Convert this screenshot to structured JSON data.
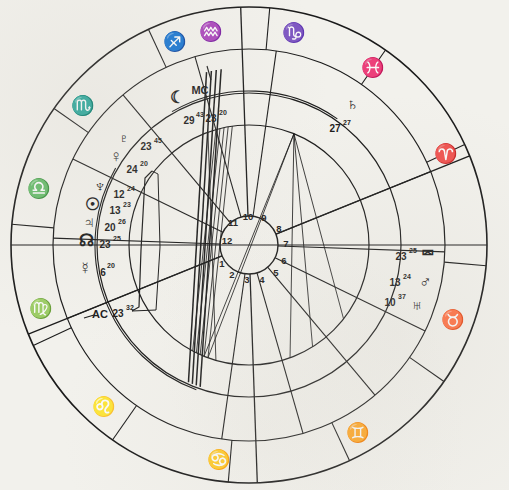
{
  "chart": {
    "background_color": "#f2f1ec",
    "ink_color": "#1a1a1a",
    "center": {
      "x": 249,
      "y": 245
    },
    "radii": {
      "outer_rim": 238,
      "sign_band_inner": 196,
      "house_band_inner": 152,
      "planet_ring": 120,
      "hub": 29
    }
  },
  "zodiac_signs": [
    {
      "name": "aries",
      "glyph": "♈",
      "angle_deg": 65,
      "label": "Aries"
    },
    {
      "name": "taurus",
      "glyph": "♉",
      "angle_deg": 110,
      "label": "Taurus"
    },
    {
      "name": "gemini",
      "glyph": "♊",
      "angle_deg": 150,
      "label": "Gemini"
    },
    {
      "name": "cancer",
      "glyph": "♋",
      "angle_deg": 188,
      "label": "Cancer"
    },
    {
      "name": "leo",
      "glyph": "♌",
      "angle_deg": 222,
      "label": "Leo"
    },
    {
      "name": "virgo",
      "glyph": "♍",
      "angle_deg": 253,
      "label": "Virgo"
    },
    {
      "name": "libra",
      "glyph": "♎",
      "angle_deg": 285,
      "label": "Libra"
    },
    {
      "name": "scorpio",
      "glyph": "♏",
      "angle_deg": 310,
      "label": "Scorpio"
    },
    {
      "name": "sagittarius",
      "glyph": "♐",
      "angle_deg": 340,
      "label": "Sagittarius"
    },
    {
      "name": "capricorn",
      "glyph": "♑",
      "angle_deg": 12,
      "label": "Capricorn"
    },
    {
      "name": "aquarius",
      "glyph": "♒",
      "angle_deg": 350,
      "label": "Aquarius"
    },
    {
      "name": "pisces",
      "glyph": "♓",
      "angle_deg": 35,
      "label": "Pisces"
    }
  ],
  "house_numbers": [
    {
      "label": "1",
      "x": 222,
      "y": 263
    },
    {
      "label": "2",
      "x": 232,
      "y": 274
    },
    {
      "label": "3",
      "x": 247,
      "y": 279
    },
    {
      "label": "4",
      "x": 262,
      "y": 279
    },
    {
      "label": "5",
      "x": 276,
      "y": 272
    },
    {
      "label": "6",
      "x": 284,
      "y": 260
    },
    {
      "label": "7",
      "x": 286,
      "y": 243
    },
    {
      "label": "8",
      "x": 279,
      "y": 228
    },
    {
      "label": "9",
      "x": 264,
      "y": 217
    },
    {
      "label": "10",
      "x": 248,
      "y": 216
    },
    {
      "label": "11",
      "x": 233,
      "y": 222
    },
    {
      "label": "12",
      "x": 227,
      "y": 240
    }
  ],
  "planets": [
    {
      "name": "pluto",
      "glyph": "♇",
      "label": "Pluto",
      "degree": "23",
      "minute": "45",
      "glyph_x": 124,
      "glyph_y": 138,
      "deg_x": 146,
      "deg_y": 146,
      "min_x": 158,
      "min_y": 140
    },
    {
      "name": "venus",
      "glyph": "♀",
      "label": "Venus",
      "degree": "24",
      "minute": "20",
      "glyph_x": 116,
      "glyph_y": 156,
      "deg_x": 132,
      "deg_y": 169,
      "min_x": 144,
      "min_y": 163
    },
    {
      "name": "neptune",
      "glyph": "♆",
      "label": "Neptune",
      "degree": "12",
      "minute": "24",
      "glyph_x": 100,
      "glyph_y": 186,
      "deg_x": 119,
      "deg_y": 194,
      "min_x": 131,
      "min_y": 188
    },
    {
      "name": "sun",
      "glyph": "☉",
      "label": "Sun",
      "degree": "13",
      "minute": "23",
      "glyph_x": 92,
      "glyph_y": 204,
      "deg_x": 115,
      "deg_y": 210,
      "min_x": 127,
      "min_y": 204
    },
    {
      "name": "jupiter",
      "glyph": "♃",
      "label": "Jupiter",
      "degree": "20",
      "minute": "26",
      "glyph_x": 89,
      "glyph_y": 222,
      "deg_x": 110,
      "deg_y": 227,
      "min_x": 122,
      "min_y": 221
    },
    {
      "name": "north-node",
      "glyph": "☊",
      "label": "North Node",
      "degree": "23",
      "minute": "25",
      "glyph_x": 86,
      "glyph_y": 240,
      "deg_x": 105,
      "deg_y": 244,
      "min_x": 117,
      "min_y": 238
    },
    {
      "name": "mercury",
      "glyph": "☿",
      "label": "Mercury",
      "degree": "6",
      "minute": "20",
      "glyph_x": 85,
      "glyph_y": 268,
      "deg_x": 103,
      "deg_y": 272,
      "min_x": 111,
      "min_y": 265
    },
    {
      "name": "ascendant",
      "glyph": "AC",
      "label": "Ascendant",
      "degree": "23",
      "minute": "32",
      "glyph_x": 100,
      "glyph_y": 314,
      "deg_x": 118,
      "deg_y": 313,
      "min_x": 130,
      "min_y": 307
    },
    {
      "name": "moon",
      "glyph": "☾",
      "label": "Moon",
      "degree": "29",
      "minute": "43",
      "glyph_x": 177,
      "glyph_y": 97,
      "deg_x": 189,
      "deg_y": 120,
      "min_x": 200,
      "min_y": 114
    },
    {
      "name": "midheaven",
      "glyph": "MC",
      "label": "Midheaven",
      "degree": "23",
      "minute": "20",
      "glyph_x": 200,
      "glyph_y": 90,
      "deg_x": 211,
      "deg_y": 118,
      "min_x": 223,
      "min_y": 112
    },
    {
      "name": "saturn",
      "glyph": "♄",
      "label": "Saturn",
      "degree": "27",
      "minute": "27",
      "glyph_x": 352,
      "glyph_y": 104,
      "deg_x": 335,
      "deg_y": 128,
      "min_x": 347,
      "min_y": 122
    },
    {
      "name": "south-node",
      "glyph": "⮹",
      "label": "South Node",
      "degree": "23",
      "minute": "25",
      "glyph_x": 428,
      "glyph_y": 253,
      "deg_x": 401,
      "deg_y": 256,
      "min_x": 413,
      "min_y": 250
    },
    {
      "name": "mars",
      "glyph": "♂",
      "label": "Mars",
      "degree": "13",
      "minute": "24",
      "glyph_x": 425,
      "glyph_y": 281,
      "deg_x": 395,
      "deg_y": 282,
      "min_x": 407,
      "min_y": 276
    },
    {
      "name": "uranus",
      "glyph": "♅",
      "label": "Uranus",
      "degree": "10",
      "minute": "37",
      "glyph_x": 417,
      "glyph_y": 305,
      "deg_x": 390,
      "deg_y": 302,
      "min_x": 402,
      "min_y": 296
    }
  ],
  "aspect_lines": [
    {
      "from_angle": 22,
      "to_angle": 200,
      "name": "aspect-saturn-sun"
    },
    {
      "from_angle": 22,
      "to_angle": 202,
      "name": "aspect-saturn-neptune"
    },
    {
      "from_angle": 22,
      "to_angle": 160,
      "name": "aspect-saturn-venus"
    },
    {
      "from_angle": 22,
      "to_angle": 148,
      "name": "aspect-saturn-pluto"
    },
    {
      "from_angle": 22,
      "to_angle": 128,
      "name": "aspect-saturn-moon"
    },
    {
      "from_angle": 200,
      "to_angle": 352,
      "name": "aspect-sun-mars"
    },
    {
      "from_angle": 202,
      "to_angle": 350,
      "name": "aspect-neptune-mars"
    },
    {
      "from_angle": 204,
      "to_angle": 348,
      "name": "aspect-jupiter-uranus"
    },
    {
      "from_angle": 206,
      "to_angle": 346,
      "name": "aspect-node-southnode"
    },
    {
      "from_angle": 208,
      "to_angle": 344,
      "name": "aspect-mercury-uranus"
    },
    {
      "from_angle": 196,
      "to_angle": 340,
      "name": "aspect-pluto-uranus"
    }
  ]
}
